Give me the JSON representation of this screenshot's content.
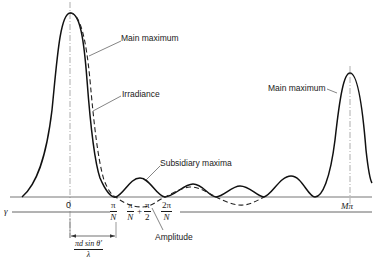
{
  "figure": {
    "type": "diagram",
    "labels": {
      "main_maximum_left": "Main maximum",
      "irradiance": "Irradiance",
      "subsidiary_maxima": "Subsidiary maxima",
      "main_maximum_right": "Main maximum",
      "amplitude": "Amplitude"
    },
    "axis": {
      "variable": "γ",
      "ticks": {
        "origin": "0",
        "pi_over_N_num": "π",
        "pi_over_N_den": "N",
        "pi_over_N_plus_num1": "π",
        "pi_over_N_plus_den1": "N",
        "plus": "+",
        "pi_over_2_num": "π",
        "pi_over_2_den": "2",
        "two_pi_over_N_num": "2π",
        "two_pi_over_N_den": "N",
        "M_pi": "Mπ"
      },
      "dimension": {
        "numerator": "πd sin θ'",
        "denominator": "λ"
      }
    },
    "colors": {
      "ink": "#1a1a1a",
      "axis": "#555555",
      "background": "#ffffff"
    }
  }
}
